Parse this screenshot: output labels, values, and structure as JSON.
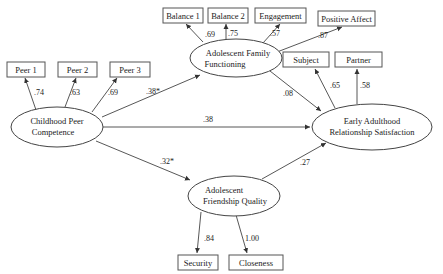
{
  "latent": {
    "childhood": {
      "line1": "Childhood Peer",
      "line2": "Competence"
    },
    "family": {
      "line1": "Adolescent Family",
      "line2": "Functioning"
    },
    "friendship": {
      "line1": "Adolescent",
      "line2": "Friendship Quality"
    },
    "adult": {
      "line1": "Early Adulthood",
      "line2": "Relationship Satisfaction"
    }
  },
  "indicators": {
    "peer1": "Peer 1",
    "peer2": "Peer 2",
    "peer3": "Peer 3",
    "balance1": "Balance 1",
    "balance2": "Balance 2",
    "engagement": "Engagement",
    "positive_affect": "Positive Affect",
    "subject": "Subject",
    "partner": "Partner",
    "security": "Security",
    "closeness": "Closeness"
  },
  "loadings": {
    "peer1": ".74",
    "peer2": ".63",
    "peer3": ".69",
    "balance1": ".69",
    "balance2": ".75",
    "engagement": ".57",
    "positive_affect": ".87",
    "subject": ".65",
    "partner": ".58",
    "security": ".84",
    "closeness": "1.00"
  },
  "paths": {
    "childhood_to_family": ".38*",
    "childhood_to_adult": ".38",
    "childhood_to_friendship": ".32*",
    "family_to_adult": ".08",
    "friendship_to_adult": ".27"
  }
}
